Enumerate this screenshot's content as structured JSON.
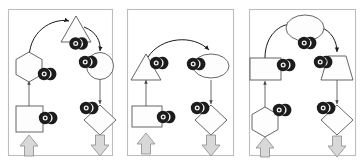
{
  "figure": {
    "title": "",
    "panel_count": 3,
    "width": 364,
    "height": 165,
    "background_color": "#ffffff",
    "frame_color": "#bdbdbd",
    "shape_fill_color": "#fdfdfd",
    "shape_stroke_color": "#555555",
    "connector_color": "#444444",
    "curve_color": "#1a1a1a",
    "block_arrow_fill": "#d8d8d8",
    "block_arrow_stroke": "#8a8a8a",
    "badge_color": "#1c1c1c"
  },
  "panels": [
    {
      "id": "panel-1",
      "label": "",
      "nodes": [
        {
          "name": "triangle-node",
          "shape": "triangle",
          "badge": "gear-badge-icon",
          "badge_position": "bottom"
        },
        {
          "name": "hexagon-node",
          "shape": "hexagon",
          "badge": "gear-badge-icon",
          "badge_position": "bottom-right"
        },
        {
          "name": "circle-node",
          "shape": "circle",
          "badge": "gear-badge-icon",
          "badge_position": "left"
        },
        {
          "name": "square-node",
          "shape": "square",
          "badge": "gear-badge-icon",
          "badge_position": "right"
        },
        {
          "name": "diamond-node",
          "shape": "diamond",
          "badge": "gear-badge-icon",
          "badge_position": "top-left"
        }
      ],
      "edges": [
        {
          "from": "hexagon-node",
          "to": "triangle-node",
          "style": "curved"
        },
        {
          "from": "triangle-node",
          "to": "circle-node",
          "style": "curved"
        },
        {
          "from": "square-node",
          "to": "hexagon-node",
          "style": "straight"
        },
        {
          "from": "circle-node",
          "to": "diamond-node",
          "style": "straight"
        }
      ],
      "io_arrows": [
        {
          "name": "input-block-arrow",
          "direction": "up",
          "position": "bottom-left"
        },
        {
          "name": "output-block-arrow",
          "direction": "down",
          "position": "bottom-right"
        }
      ]
    },
    {
      "id": "panel-2",
      "label": "",
      "nodes": [
        {
          "name": "triangle-node",
          "shape": "triangle",
          "badge": "gear-badge-icon",
          "badge_position": "right"
        },
        {
          "name": "ellipse-node",
          "shape": "ellipse",
          "badge": "gear-badge-icon",
          "badge_position": "left"
        },
        {
          "name": "rectangle-node",
          "shape": "rectangle",
          "badge": "gear-badge-icon",
          "badge_position": "right"
        },
        {
          "name": "diamond-node",
          "shape": "diamond",
          "badge": "gear-badge-icon",
          "badge_position": "top-left"
        }
      ],
      "edges": [
        {
          "from": "triangle-node",
          "to": "ellipse-node",
          "style": "curved"
        },
        {
          "from": "rectangle-node",
          "to": "triangle-node",
          "style": "straight"
        },
        {
          "from": "ellipse-node",
          "to": "diamond-node",
          "style": "straight"
        }
      ],
      "io_arrows": [
        {
          "name": "input-block-arrow",
          "direction": "up",
          "position": "bottom-left"
        },
        {
          "name": "output-block-arrow",
          "direction": "down",
          "position": "bottom-right"
        }
      ]
    },
    {
      "id": "panel-3",
      "label": "",
      "nodes": [
        {
          "name": "ellipse-node",
          "shape": "ellipse",
          "badge": "gear-badge-icon",
          "badge_position": "bottom"
        },
        {
          "name": "rectangle-node",
          "shape": "rectangle",
          "badge": "gear-badge-icon",
          "badge_position": "right"
        },
        {
          "name": "trapezoid-node",
          "shape": "trapezoid",
          "badge": "gear-badge-icon",
          "badge_position": "left"
        },
        {
          "name": "hexagon-node",
          "shape": "hexagon",
          "badge": "gear-badge-icon",
          "badge_position": "top-right"
        },
        {
          "name": "diamond-node",
          "shape": "diamond",
          "badge": "gear-badge-icon",
          "badge_position": "top-left"
        }
      ],
      "edges": [
        {
          "from": "rectangle-node",
          "to": "ellipse-node",
          "style": "curved"
        },
        {
          "from": "ellipse-node",
          "to": "trapezoid-node",
          "style": "curved"
        },
        {
          "from": "hexagon-node",
          "to": "rectangle-node",
          "style": "straight"
        },
        {
          "from": "trapezoid-node",
          "to": "diamond-node",
          "style": "straight"
        }
      ],
      "io_arrows": [
        {
          "name": "input-block-arrow",
          "direction": "up",
          "position": "bottom-left"
        },
        {
          "name": "output-block-arrow",
          "direction": "down",
          "position": "bottom-right"
        }
      ]
    }
  ]
}
